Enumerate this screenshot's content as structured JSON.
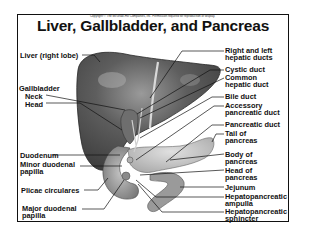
{
  "copyright": "Copyright © The McGraw-Hill Companies, Inc. Permission required for reproduction or display.",
  "title": "Liver, Gallbladder, and Pancreas",
  "labels_left": [
    {
      "id": "liver-right-lobe",
      "text": "Liver (right lobe)"
    },
    {
      "id": "gallbladder",
      "text": "Gallbladder"
    },
    {
      "id": "neck",
      "text": "Neck"
    },
    {
      "id": "head",
      "text": "Head"
    },
    {
      "id": "duodenum",
      "text": "Duodenum"
    },
    {
      "id": "minor-duodenal-papilla",
      "text": "Minor duodenal\npapilla"
    },
    {
      "id": "plicae-circulares",
      "text": "Plicae circulares"
    },
    {
      "id": "major-duodenal-papilla",
      "text": "Major duodenal\npapilla"
    }
  ],
  "labels_right": [
    {
      "id": "right-left-hepatic-ducts",
      "text": "Right and left\nhepatic ducts"
    },
    {
      "id": "cystic-duct",
      "text": "Cystic duct"
    },
    {
      "id": "common-hepatic-duct",
      "text": "Common\nhepatic duct"
    },
    {
      "id": "bile-duct",
      "text": "Bile duct"
    },
    {
      "id": "accessory-pancreatic-duct",
      "text": "Accessory\npancreatic duct"
    },
    {
      "id": "pancreatic-duct",
      "text": "Pancreatic duct"
    },
    {
      "id": "tail-of-pancreas",
      "text": "Tail of\npancreas"
    },
    {
      "id": "body-of-pancreas",
      "text": "Body of\npancreas"
    },
    {
      "id": "head-of-pancreas",
      "text": "Head of\npancreas"
    },
    {
      "id": "jejunum",
      "text": "Jejunum"
    },
    {
      "id": "hepatopancreatic-ampulla",
      "text": "Hepatopancreatic\nampulla"
    },
    {
      "id": "hepatopancreatic-sphincter",
      "text": "Hepatopancreatic\nsphincter"
    }
  ],
  "colors": {
    "liver": "#5a5a5a",
    "liver_highlight": "#8a8a8a",
    "pancreas": "#c8c8c8",
    "duodenum": "#a0a0a0",
    "jejunum": "#9a9a9a",
    "frame": "#111111",
    "text": "#111111"
  }
}
